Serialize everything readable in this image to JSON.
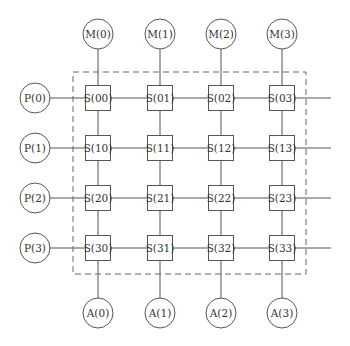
{
  "diagram": {
    "type": "crossbar-switch-network",
    "colors": {
      "stroke": "#555555",
      "dash": "#666666",
      "text": "#333333",
      "background": "#ffffff"
    },
    "columns_x": [
      98,
      160,
      221,
      282
    ],
    "rows_y": [
      98,
      148,
      198,
      248
    ],
    "memory_nodes": [
      {
        "label": "M(0)"
      },
      {
        "label": "M(1)"
      },
      {
        "label": "M(2)"
      },
      {
        "label": "M(3)"
      }
    ],
    "processor_nodes": [
      {
        "label": "P(0)"
      },
      {
        "label": "P(1)"
      },
      {
        "label": "P(2)"
      },
      {
        "label": "P(3)"
      }
    ],
    "output_nodes": [
      {
        "label": "A(0)"
      },
      {
        "label": "A(1)"
      },
      {
        "label": "A(2)"
      },
      {
        "label": "A(3)"
      }
    ],
    "switches": [
      [
        "S(00)",
        "S(01)",
        "S(02)",
        "S(03)"
      ],
      [
        "S(10)",
        "S(11)",
        "S(12)",
        "S(13)"
      ],
      [
        "S(20)",
        "S(21)",
        "S(22)",
        "S(23)"
      ],
      [
        "S(30)",
        "S(31)",
        "S(32)",
        "S(33)"
      ]
    ],
    "dashed_boundary": {
      "x": 73,
      "y": 72,
      "width": 233,
      "height": 202
    }
  }
}
